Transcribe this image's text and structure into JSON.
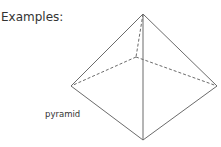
{
  "heading": "Examples:",
  "figure": {
    "label": "pyramid",
    "shape": "square pyramid",
    "line_color": "#6b6b6b",
    "vertices": {
      "apex": [
        143,
        14
      ],
      "left": [
        71,
        86
      ],
      "right": [
        217,
        86
      ],
      "front": [
        143,
        140
      ],
      "back": [
        136,
        57
      ]
    }
  }
}
